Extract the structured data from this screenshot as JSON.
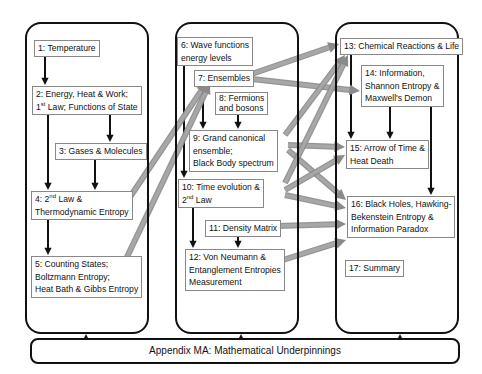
{
  "columns": [
    {
      "name": "classical-thermodynamics"
    },
    {
      "name": "statistical-mechanics"
    },
    {
      "name": "applications"
    }
  ],
  "nodes": {
    "n1": {
      "lines": [
        "1: Temperature"
      ]
    },
    "n2": {
      "lines": [
        "2: Energy, Heat & Work;",
        "1st Law; Functions of State"
      ]
    },
    "n3": {
      "lines": [
        "3: Gases & Molecules"
      ]
    },
    "n4": {
      "lines": [
        "4: 2nd Law &",
        "Thermodynamic Entropy"
      ]
    },
    "n5": {
      "lines": [
        "5: Counting States;",
        "Boltzmann Entropy;",
        "Heat Bath & Gibbs Entropy"
      ]
    },
    "n6": {
      "lines": [
        "6: Wave functions",
        "energy levels"
      ]
    },
    "n7": {
      "lines": [
        "7: Ensembles"
      ]
    },
    "n8": {
      "lines": [
        "8: Fermions",
        "and bosons"
      ]
    },
    "n9": {
      "lines": [
        "9: Grand canonical",
        "ensemble;",
        "Black Body spectrum"
      ]
    },
    "n10": {
      "lines": [
        "10: Time evolution &",
        "2nd Law"
      ]
    },
    "n11": {
      "lines": [
        "11: Density Matrix"
      ]
    },
    "n12": {
      "lines": [
        "12: Von Neumann &",
        "Entanglement Entropies",
        "Measurement"
      ]
    },
    "n13": {
      "lines": [
        "13: Chemical Reactions & Life"
      ]
    },
    "n14": {
      "lines": [
        "14: Information,",
        "Shannon Entropy &",
        "Maxwell's Demon"
      ]
    },
    "n15": {
      "lines": [
        "15: Arrow of Time &",
        "Heat Death"
      ]
    },
    "n16": {
      "lines": [
        "16: Black Holes, Hawking-",
        "Bekenstein Entropy &",
        "Information Paradox"
      ]
    },
    "n17": {
      "lines": [
        "17: Summary"
      ]
    }
  },
  "appendix": {
    "label": "Appendix MA: Mathematical Underpinnings"
  },
  "edges": {
    "black": [
      [
        "n1",
        "n2"
      ],
      [
        "n2",
        "n3"
      ],
      [
        "n2",
        "n4"
      ],
      [
        "n3",
        "n4"
      ],
      [
        "n4",
        "n5"
      ],
      [
        "n6",
        "n10"
      ],
      [
        "n7",
        "n9"
      ],
      [
        "n8",
        "n9"
      ],
      [
        "n10",
        "n12"
      ],
      [
        "n11",
        "n12"
      ],
      [
        "n13",
        "n15"
      ],
      [
        "n14",
        "n15"
      ],
      [
        "n14",
        "n16"
      ],
      [
        "appendix",
        "col1"
      ],
      [
        "appendix",
        "col2"
      ],
      [
        "appendix",
        "col3"
      ]
    ],
    "grey": [
      [
        "n4",
        "n7"
      ],
      [
        "n5",
        "n7"
      ],
      [
        "n7",
        "n13"
      ],
      [
        "n7",
        "n14"
      ],
      [
        "n9",
        "n13"
      ],
      [
        "n9",
        "n15"
      ],
      [
        "n9",
        "n16"
      ],
      [
        "n10",
        "n13"
      ],
      [
        "n10",
        "n15"
      ],
      [
        "n10",
        "n16"
      ],
      [
        "n11",
        "n16"
      ],
      [
        "n12",
        "n16"
      ]
    ]
  },
  "colors": {
    "black_arrow": "#111111",
    "grey_arrow": "#a8a8a8",
    "grey_arrow_edge": "#8a8a8a"
  }
}
